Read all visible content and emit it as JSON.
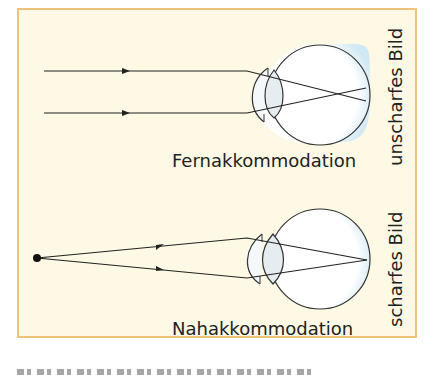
{
  "figure": {
    "panel_background": "#fdf9e4",
    "panel_border": "#f1c27a",
    "top": {
      "title": "Fernakkommodation",
      "side_label": "unscharfes Bild"
    },
    "bottom": {
      "title": "Nahakkommodation",
      "side_label": "scharfes Bild"
    }
  }
}
